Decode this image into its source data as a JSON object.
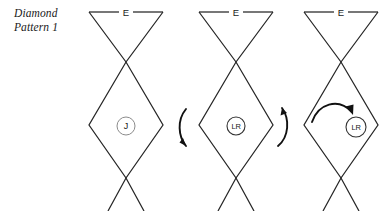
{
  "caption": {
    "line1": "Diamond",
    "line2": "Pattern 1"
  },
  "colors": {
    "stroke": "#262626",
    "circle_stroke": "#8c8c8c",
    "arrow": "#111111",
    "text": "#1a1a1a",
    "background": "#ffffff"
  },
  "figures": [
    {
      "id": "figure-1",
      "origin_x": 89,
      "top_label": "E",
      "marker": {
        "text": "J",
        "position": "diamond-center",
        "cx": 126,
        "cy": 126,
        "r": 9
      },
      "arrows": []
    },
    {
      "id": "figure-2",
      "origin_x": 199,
      "top_label": "E",
      "marker": {
        "text": "LR",
        "position": "diamond-center",
        "cx": 236,
        "cy": 126,
        "r": 9
      },
      "arrows": [
        {
          "name": "rotation-arrow-left",
          "direction": "down",
          "side": "left"
        },
        {
          "name": "rotation-arrow-right",
          "direction": "up",
          "side": "right"
        }
      ]
    },
    {
      "id": "figure-3",
      "origin_x": 304,
      "top_label": "E",
      "marker": {
        "text": "LR",
        "position": "outside-right",
        "cx": 356,
        "cy": 127,
        "r": 10
      },
      "arrows": [
        {
          "name": "rotation-arrow-over",
          "direction": "clockwise",
          "side": "top"
        }
      ]
    }
  ],
  "geometry": {
    "top_y": 12,
    "cross_top_y": 62,
    "diamond_mid_y": 125,
    "cross_bottom_y": 178,
    "bottom_y": 211,
    "half_width": 37
  }
}
